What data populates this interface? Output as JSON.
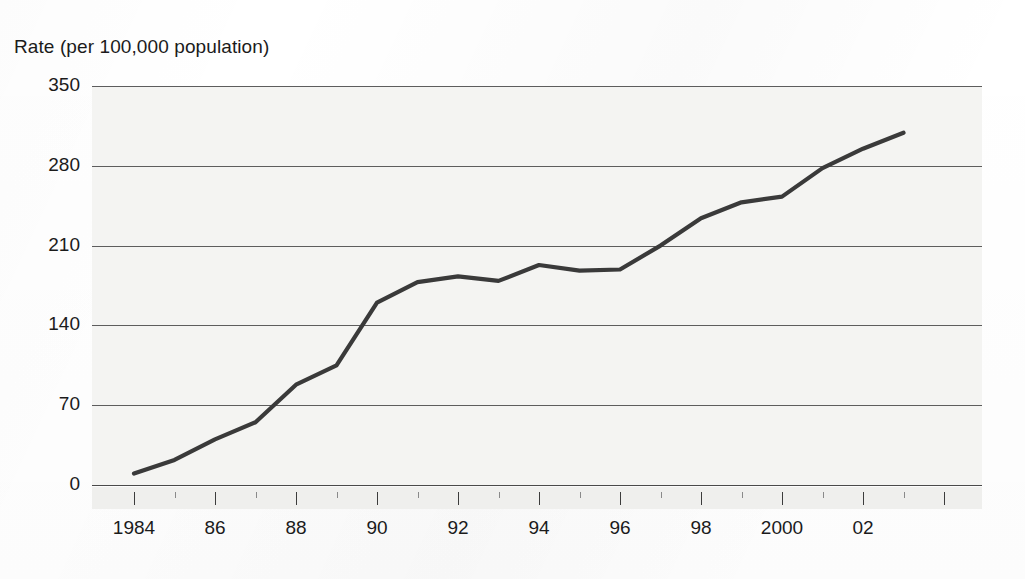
{
  "chart_data": {
    "type": "line",
    "title": "",
    "ylabel": "Rate (per 100,000 population)",
    "xlabel": "",
    "ylim": [
      0,
      350
    ],
    "xlim": [
      1984,
      2003
    ],
    "grid": true,
    "legend": "none",
    "y_ticks": [
      350,
      280,
      210,
      140,
      70,
      0
    ],
    "x_ticks": [
      1984,
      1986,
      1988,
      1990,
      1992,
      1994,
      1996,
      1998,
      2000,
      2002
    ],
    "x_tick_labels": [
      "1984",
      "86",
      "88",
      "90",
      "92",
      "94",
      "96",
      "98",
      "2000",
      "02"
    ],
    "x_minor_ticks": [
      1985,
      1987,
      1989,
      1991,
      1993,
      1995,
      1997,
      1999,
      2001,
      2003
    ],
    "line_color": "#3a3a3a",
    "series": [
      {
        "name": "Rate",
        "x": [
          1984,
          1985,
          1986,
          1987,
          1988,
          1989,
          1990,
          1991,
          1992,
          1993,
          1994,
          1995,
          1996,
          1997,
          1998,
          1999,
          2000,
          2001,
          2002,
          2003
        ],
        "values": [
          10,
          22,
          40,
          55,
          88,
          105,
          160,
          178,
          183,
          179,
          193,
          188,
          189,
          210,
          234,
          248,
          253,
          278,
          295,
          309
        ]
      }
    ]
  },
  "axes": {
    "y_label": "Rate (per 100,000 population)",
    "y_tick_labels": [
      "350",
      "280",
      "210",
      "140",
      "70",
      "0"
    ],
    "x_tick_labels": [
      "1984",
      "86",
      "88",
      "90",
      "92",
      "94",
      "96",
      "98",
      "2000",
      "02"
    ]
  }
}
